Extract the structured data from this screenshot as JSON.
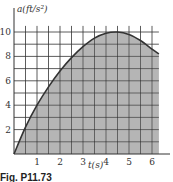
{
  "chart_data": {
    "type": "area",
    "title": "",
    "xlabel": "t(s)",
    "ylabel": "a(ft/s²)",
    "xlim": [
      0,
      6.3
    ],
    "ylim": [
      0,
      11
    ],
    "x_ticks": [
      "1",
      "2",
      "3",
      "4",
      "5",
      "6"
    ],
    "y_ticks": [
      "2",
      "4",
      "6",
      "8",
      "10"
    ],
    "grid": true,
    "grid_x_step": 0.5,
    "grid_y_step": 1,
    "fill_color": "#b5b5b5",
    "line_color": "#333333",
    "series": [
      {
        "name": "a(t)",
        "x": [
          0,
          0.5,
          1,
          1.5,
          2,
          2.5,
          3,
          3.5,
          4,
          4.5,
          5,
          5.5,
          6,
          6.3
        ],
        "values": [
          0,
          2.2,
          4.0,
          5.5,
          6.8,
          7.9,
          8.8,
          9.5,
          9.9,
          10.0,
          9.8,
          9.3,
          8.6,
          8.2
        ]
      }
    ]
  },
  "caption": "Fig. P11.73"
}
